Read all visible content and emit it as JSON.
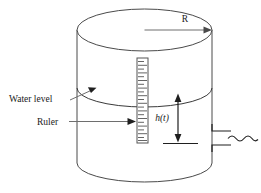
{
  "figure": {
    "type": "engineering-diagram",
    "background_color": "#ffffff",
    "line_color": "#3a3a3a"
  },
  "labels": {
    "radius": "R",
    "water_level": "Water level",
    "ruler": "Ruler",
    "height_h": "h",
    "height_open_paren": "(",
    "height_t": "t",
    "height_close_paren": ")",
    "height_full": "h(t)"
  },
  "geometry": {
    "tank_left_x": 77,
    "tank_right_x": 212,
    "tank_top_y": 30,
    "tank_bottom_y": 163,
    "ellipse_rx": 67.5,
    "ellipse_ry": 21,
    "water_level_y": 88,
    "ruler_left_x": 137,
    "ruler_right_x": 148,
    "ruler_top_y": 58,
    "ruler_bottom_y": 143,
    "ruler_tick_count": 22,
    "dim_arrow_x": 178,
    "dim_top_y": 95,
    "dim_bottom_y": 141,
    "outlet_x": 212,
    "outlet_top_y": 131,
    "outlet_bottom_y": 145
  },
  "annotations": [
    {
      "name": "radius-arrow",
      "from": "center of top ellipse",
      "to": "right rim of top ellipse"
    },
    {
      "name": "water-level-leader",
      "from": "Water level text",
      "to": "water surface arc"
    },
    {
      "name": "ruler-leader",
      "from": "Ruler text",
      "to": "ruler strip"
    },
    {
      "name": "height-dimension",
      "from": "water surface",
      "to": "outlet baseline"
    },
    {
      "name": "outflow-stream",
      "description": "wavy water line exiting outlet pipe"
    }
  ]
}
